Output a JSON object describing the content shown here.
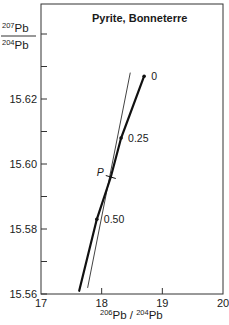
{
  "chart_data": {
    "type": "line",
    "title": "Pyrite, Bonneterre",
    "xlabel": "206Pb / 204Pb",
    "ylabel": "207Pb / 204Pb",
    "xlim": [
      17,
      20
    ],
    "ylim": [
      15.56,
      15.652
    ],
    "x_ticks": [
      17,
      18,
      19,
      20
    ],
    "x_tick_labels": [
      "17",
      "18",
      "19",
      "20"
    ],
    "y_ticks": [
      15.56,
      15.57,
      15.58,
      15.59,
      15.6,
      15.61,
      15.62,
      15.63,
      15.64
    ],
    "y_tick_labels": [
      "15.56",
      "",
      "15.58",
      "",
      "15.60",
      "",
      "15.62",
      "",
      ""
    ],
    "grid": false,
    "series": [
      {
        "name": "growth curve (thick)",
        "style": "thick",
        "points": [
          {
            "x": 17.63,
            "y": 15.561
          },
          {
            "x": 17.92,
            "y": 15.583
          },
          {
            "x": 18.15,
            "y": 15.596
          },
          {
            "x": 18.32,
            "y": 15.608
          },
          {
            "x": 18.7,
            "y": 15.627
          }
        ]
      },
      {
        "name": "reference line (thin)",
        "style": "thin",
        "points": [
          {
            "x": 17.77,
            "y": 15.562
          },
          {
            "x": 18.47,
            "y": 15.628
          }
        ]
      }
    ],
    "labeled_points": [
      {
        "label": "0",
        "x": 18.7,
        "y": 15.627
      },
      {
        "label": "0.25",
        "x": 18.32,
        "y": 15.608
      },
      {
        "label": "0.50",
        "x": 17.92,
        "y": 15.583
      }
    ],
    "annotations": [
      {
        "label": "P",
        "x": 18.15,
        "y": 15.596,
        "kind": "tick-mark"
      }
    ]
  },
  "labels": {
    "title": "Pyrite, Bonneterre",
    "y_num_sup": "207",
    "y_num": "Pb",
    "y_den_sup": "204",
    "y_den": "Pb",
    "x_sup1": "206",
    "x_mid": "Pb / ",
    "x_sup2": "204",
    "x_end": "Pb",
    "p_label": "P"
  }
}
